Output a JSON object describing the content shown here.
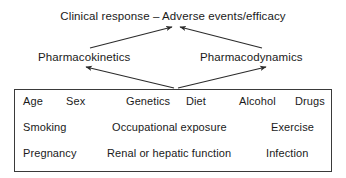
{
  "diagram": {
    "title_node": {
      "label": "Clinical response – Adverse events/efficacy"
    },
    "nodes": [
      {
        "id": "pharmacokinetics",
        "label": "Pharmacokinetics"
      },
      {
        "id": "pharmacodynamics",
        "label": "Pharmacodynamics"
      }
    ],
    "factors_box": {
      "rows": [
        {
          "items": [
            {
              "label": "Age",
              "x": 8
            },
            {
              "label": "Sex",
              "x": 51
            },
            {
              "label": "Genetics",
              "x": 111
            },
            {
              "label": "Diet",
              "x": 171
            },
            {
              "label": "Alcohol",
              "x": 224
            },
            {
              "label": "Drugs",
              "x": 280
            }
          ]
        },
        {
          "items": [
            {
              "label": "Smoking",
              "x": 8
            },
            {
              "label": "Occupational exposure",
              "x": 97
            },
            {
              "label": "Exercise",
              "x": 256
            }
          ]
        },
        {
          "items": [
            {
              "label": "Pregnancy",
              "x": 8
            },
            {
              "label": "Renal or hepatic function",
              "x": 92
            },
            {
              "label": "Infection",
              "x": 251
            }
          ]
        }
      ]
    },
    "arrows": [
      {
        "name": "pk-to-outcome",
        "from": {
          "x": 90,
          "y": 48
        },
        "to": {
          "x": 172,
          "y": 27
        }
      },
      {
        "name": "pd-to-outcome",
        "from": {
          "x": 262,
          "y": 48
        },
        "to": {
          "x": 180,
          "y": 27
        }
      },
      {
        "name": "factors-to-pk",
        "from": {
          "x": 174,
          "y": 88
        },
        "to": {
          "x": 86,
          "y": 67
        }
      },
      {
        "name": "factors-to-pd",
        "from": {
          "x": 178,
          "y": 88
        },
        "to": {
          "x": 266,
          "y": 67
        }
      }
    ],
    "style": {
      "line_color": "#2b2b2b",
      "box_border_color": "#3a3a3a",
      "text_color": "#1a1a1a",
      "background": "#ffffff"
    }
  }
}
